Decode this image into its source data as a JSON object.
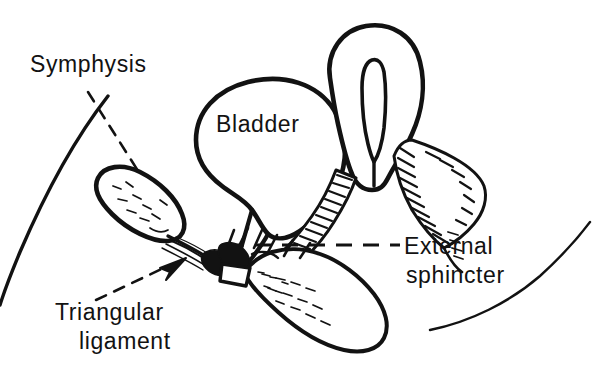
{
  "figure": {
    "type": "line-drawing",
    "ink_color": "#121212",
    "background_color": "#ffffff",
    "width": 612,
    "height": 384
  },
  "labels": {
    "symphysis": "Symphysis",
    "bladder": "Bladder",
    "external_sphincter_line1": "External",
    "external_sphincter_line2": "sphincter",
    "triangular_line1": "Triangular",
    "triangular_line2": "ligament"
  },
  "structures": [
    "abdominal-wall",
    "pubic-symphysis",
    "bladder",
    "bladder-neck",
    "rectum",
    "levator-ani-muscle",
    "prostate",
    "urethra",
    "triangular-ligament",
    "perineal-contour"
  ],
  "leaders": [
    {
      "name": "symphysis-leader",
      "style": "dashed"
    },
    {
      "name": "external-sphincter-leader",
      "style": "dashed-horizontal"
    },
    {
      "name": "triangular-ligament-leader",
      "style": "dashed-with-arrow"
    }
  ]
}
